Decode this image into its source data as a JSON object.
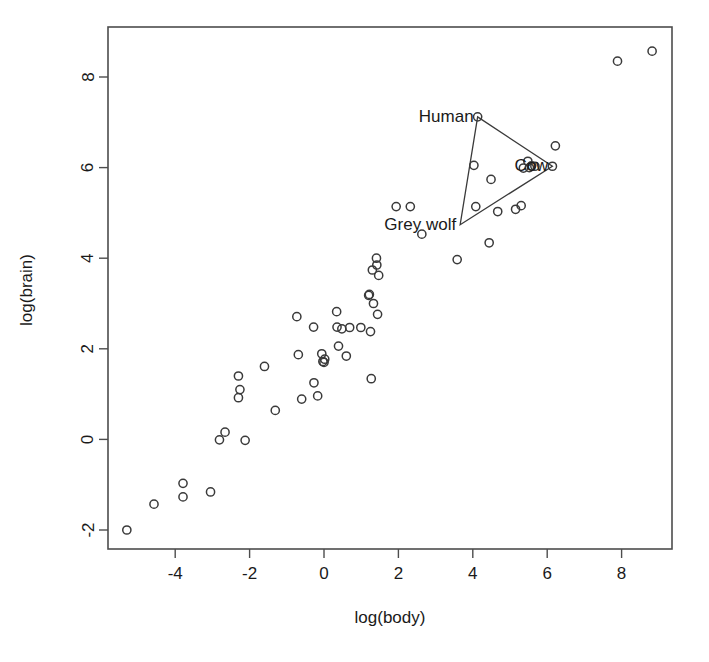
{
  "chart_data": {
    "type": "scatter",
    "title": "",
    "xlabel": "log(body)",
    "ylabel": "log(brain)",
    "xlim": [
      -5.8,
      9.4
    ],
    "ylim": [
      -2.45,
      8.9
    ],
    "xticks": [
      -4,
      -2,
      0,
      2,
      4,
      6,
      8
    ],
    "yticks": [
      -2,
      0,
      2,
      4,
      6,
      8
    ],
    "grid": false,
    "legend": null,
    "marker": "open-circle",
    "annotations": [
      {
        "label": "Human",
        "x": 4.13,
        "y": 7.12,
        "anchor": "right"
      },
      {
        "label": "Cow",
        "x": 6.14,
        "y": 6.03,
        "anchor": "right"
      },
      {
        "label": "Grey wolf",
        "x": 3.66,
        "y": 4.74,
        "anchor": "right"
      }
    ],
    "hull": {
      "name": "convex-hull-triangle",
      "vertices": [
        {
          "label": "Human",
          "x": 4.13,
          "y": 7.12
        },
        {
          "label": "Cow",
          "x": 6.14,
          "y": 6.03
        },
        {
          "label": "Grey wolf",
          "x": 3.66,
          "y": 4.74
        }
      ]
    },
    "points": [
      {
        "x": -5.3,
        "y": -2.0
      },
      {
        "x": -4.57,
        "y": -1.43
      },
      {
        "x": -3.79,
        "y": -0.97
      },
      {
        "x": -3.79,
        "y": -1.27
      },
      {
        "x": -3.05,
        "y": -1.16
      },
      {
        "x": -2.81,
        "y": -0.01
      },
      {
        "x": -2.66,
        "y": 0.16
      },
      {
        "x": -2.3,
        "y": 1.4
      },
      {
        "x": -2.3,
        "y": 0.92
      },
      {
        "x": -2.26,
        "y": 1.1
      },
      {
        "x": -2.12,
        "y": -0.02
      },
      {
        "x": -1.6,
        "y": 1.61
      },
      {
        "x": -1.31,
        "y": 0.64
      },
      {
        "x": -0.73,
        "y": 2.71
      },
      {
        "x": -0.69,
        "y": 1.87
      },
      {
        "x": -0.6,
        "y": 0.89
      },
      {
        "x": -0.28,
        "y": 2.48
      },
      {
        "x": -0.27,
        "y": 1.25
      },
      {
        "x": -0.17,
        "y": 0.96
      },
      {
        "x": -0.06,
        "y": 1.89
      },
      {
        "x": -0.03,
        "y": 1.72
      },
      {
        "x": 0.0,
        "y": 1.7
      },
      {
        "x": 0.02,
        "y": 1.77
      },
      {
        "x": 0.34,
        "y": 2.82
      },
      {
        "x": 0.35,
        "y": 2.48
      },
      {
        "x": 0.39,
        "y": 2.06
      },
      {
        "x": 0.48,
        "y": 2.44
      },
      {
        "x": 0.6,
        "y": 1.84
      },
      {
        "x": 0.69,
        "y": 2.47
      },
      {
        "x": 0.99,
        "y": 2.47
      },
      {
        "x": 1.2,
        "y": 3.18
      },
      {
        "x": 1.22,
        "y": 3.2
      },
      {
        "x": 1.25,
        "y": 2.38
      },
      {
        "x": 1.27,
        "y": 1.34
      },
      {
        "x": 1.3,
        "y": 3.74
      },
      {
        "x": 1.33,
        "y": 3.0
      },
      {
        "x": 1.41,
        "y": 4.0
      },
      {
        "x": 1.42,
        "y": 3.85
      },
      {
        "x": 1.44,
        "y": 2.76
      },
      {
        "x": 1.47,
        "y": 3.62
      },
      {
        "x": 1.94,
        "y": 5.14
      },
      {
        "x": 2.32,
        "y": 5.14
      },
      {
        "x": 2.63,
        "y": 4.53
      },
      {
        "x": 3.58,
        "y": 3.97
      },
      {
        "x": 4.03,
        "y": 6.05
      },
      {
        "x": 4.08,
        "y": 5.14
      },
      {
        "x": 4.13,
        "y": 7.12
      },
      {
        "x": 4.44,
        "y": 4.34
      },
      {
        "x": 4.49,
        "y": 5.74
      },
      {
        "x": 4.67,
        "y": 5.03
      },
      {
        "x": 5.15,
        "y": 5.08
      },
      {
        "x": 5.3,
        "y": 5.16
      },
      {
        "x": 5.36,
        "y": 5.99
      },
      {
        "x": 5.48,
        "y": 6.14
      },
      {
        "x": 5.52,
        "y": 6.0
      },
      {
        "x": 5.58,
        "y": 6.04
      },
      {
        "x": 5.67,
        "y": 6.03
      },
      {
        "x": 6.14,
        "y": 6.03
      },
      {
        "x": 6.22,
        "y": 6.48
      },
      {
        "x": 7.89,
        "y": 8.35
      },
      {
        "x": 8.82,
        "y": 8.57
      }
    ]
  },
  "axis": {
    "x_title": "log(body)",
    "y_title": "log(brain)",
    "x_tick_labels": [
      "-4",
      "-2",
      "0",
      "2",
      "4",
      "6",
      "8"
    ],
    "y_tick_labels": [
      "-2",
      "0",
      "2",
      "4",
      "6",
      "8"
    ]
  },
  "colors": {
    "background": "#ffffff",
    "frame": "#4d4d4d",
    "marker": "#3a3a3a",
    "text": "#1a1a1a"
  }
}
